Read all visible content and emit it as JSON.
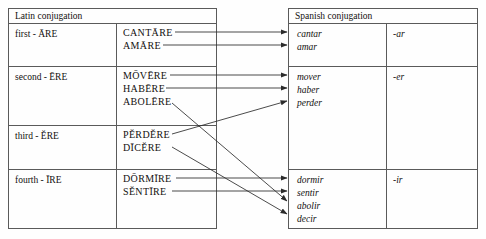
{
  "diagram": {
    "title_left": "Latin conjugation",
    "title_right": "Spanish conjugation",
    "line_color": "#2b2b2b",
    "border_color": "#5a5a5a",
    "text_color": "#12100f"
  },
  "latin": {
    "header": "Latin conjugation",
    "rows": [
      {
        "label": "first - ĀRE",
        "verbs": [
          "CANTĀRE",
          "AMĀRE"
        ]
      },
      {
        "label": "second - ĒRE",
        "verbs": [
          "MŌVĒRE",
          "HABĒRE",
          "ABOLĒRE"
        ]
      },
      {
        "label": "third - ĔRE",
        "verbs": [
          "PĔRDĔRE",
          "DĪCĔRE"
        ]
      },
      {
        "label": "fourth - ĪRE",
        "verbs": [
          "DŌRMĪRE",
          "SĔNTĪRE"
        ]
      }
    ]
  },
  "spanish": {
    "header": "Spanish conjugation",
    "rows": [
      {
        "verbs": [
          "cantar",
          "amar"
        ],
        "ending": "-ar"
      },
      {
        "verbs": [
          "mover",
          "haber",
          "perder"
        ],
        "ending": "-er"
      },
      {
        "verbs": [],
        "ending": ""
      },
      {
        "verbs": [
          "dormir",
          "sentir",
          "abolir",
          "decir"
        ],
        "ending": "-ir"
      }
    ]
  },
  "mappings": [
    {
      "from": "CANTĀRE",
      "to": "cantar"
    },
    {
      "from": "AMĀRE",
      "to": "amar"
    },
    {
      "from": "MŌVĒRE",
      "to": "mover"
    },
    {
      "from": "HABĒRE",
      "to": "haber"
    },
    {
      "from": "ABOLĒRE",
      "to": "abolir"
    },
    {
      "from": "PĔRDĔRE",
      "to": "perder"
    },
    {
      "from": "DĪCĔRE",
      "to": "decir"
    },
    {
      "from": "DŌRMĪRE",
      "to": "dormir"
    },
    {
      "from": "SĔNTĪRE",
      "to": "sentir"
    }
  ]
}
